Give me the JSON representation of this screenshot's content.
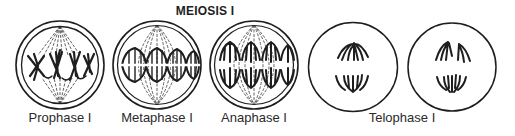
{
  "title": "MEIOSIS I",
  "colors": {
    "ink": "#1e1e1e",
    "spindle": "#3a3a3a",
    "background": "#ffffff"
  },
  "stages": [
    {
      "id": "prophase",
      "label": "Prophase I",
      "cx": 60,
      "cy": 65
    },
    {
      "id": "metaphase",
      "label": "Metaphase I",
      "cx": 157,
      "cy": 65
    },
    {
      "id": "anaphase",
      "label": "Anaphase I",
      "cx": 254,
      "cy": 65
    },
    {
      "id": "telophase",
      "label": "Telophase I",
      "cells": [
        {
          "cx": 353,
          "cy": 67
        },
        {
          "cx": 452,
          "cy": 67
        }
      ]
    }
  ]
}
